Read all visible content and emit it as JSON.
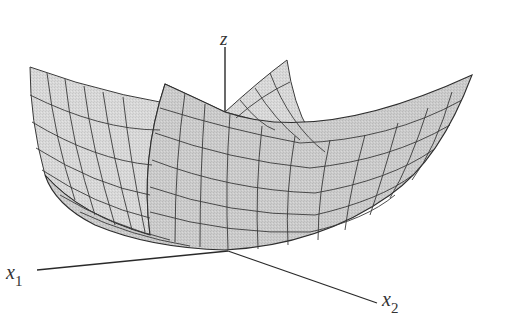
{
  "figure": {
    "type": "3d-surface",
    "surface_fill": "#c8c8c8",
    "surface_fill_back": "#d6d6d6",
    "grid_color": "#3a3a3a",
    "axis_color": "#2a2a2a",
    "grid_divisions": 10
  },
  "axes": {
    "z": {
      "label": "z"
    },
    "x1": {
      "label": "x",
      "subscript": "1"
    },
    "x2": {
      "label": "x",
      "subscript": "2"
    }
  }
}
